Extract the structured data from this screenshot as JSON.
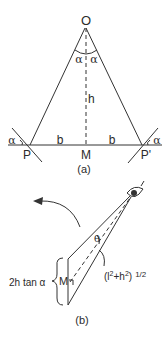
{
  "diagram": {
    "stroke_color": "#333333",
    "background": "#ffffff",
    "panel_a": {
      "caption": "(a)",
      "vertex_label": "O",
      "angle_left_top": "α",
      "angle_right_top": "α",
      "height_label": "h",
      "left_point": "P",
      "right_point": "P'",
      "mid_point": "M",
      "left_half_base": "b",
      "right_half_base": "b",
      "angle_left_mirror": "α",
      "angle_right_mirror": "α"
    },
    "panel_b": {
      "caption": "(b)",
      "width_label": "2h tan α",
      "mid_point": "M",
      "angle_label": "θ",
      "distance_label": "(l",
      "distance_sup1": "2",
      "distance_mid": "+h",
      "distance_sup2": "2",
      "distance_close": ")",
      "distance_exp": "1/2",
      "viewer_icon": "eye-icon",
      "rotation_icon": "curved-arrow-icon"
    }
  }
}
